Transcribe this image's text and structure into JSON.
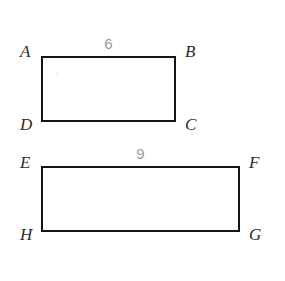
{
  "figure": {
    "type": "geometry-diagram",
    "background_color": "#ffffff",
    "stroke_color": "#141414",
    "label_color": "#2b2b2b",
    "measure_color": "#9a9a9a",
    "shapes": [
      {
        "name": "rectangle-abcd",
        "vertices": [
          "A",
          "B",
          "C",
          "D"
        ],
        "vertex_labels": {
          "top_left": "A",
          "top_right": "B",
          "bottom_right": "C",
          "bottom_left": "D"
        },
        "top_side_length": "6",
        "geometry": {
          "x": 41,
          "y": 56,
          "width": 135,
          "height": 66
        }
      },
      {
        "name": "rectangle-efgh",
        "vertices": [
          "E",
          "F",
          "G",
          "H"
        ],
        "vertex_labels": {
          "top_left": "E",
          "top_right": "F",
          "bottom_right": "G",
          "bottom_left": "H"
        },
        "top_side_length": "9",
        "geometry": {
          "x": 41,
          "y": 166,
          "width": 199,
          "height": 66
        }
      }
    ]
  }
}
